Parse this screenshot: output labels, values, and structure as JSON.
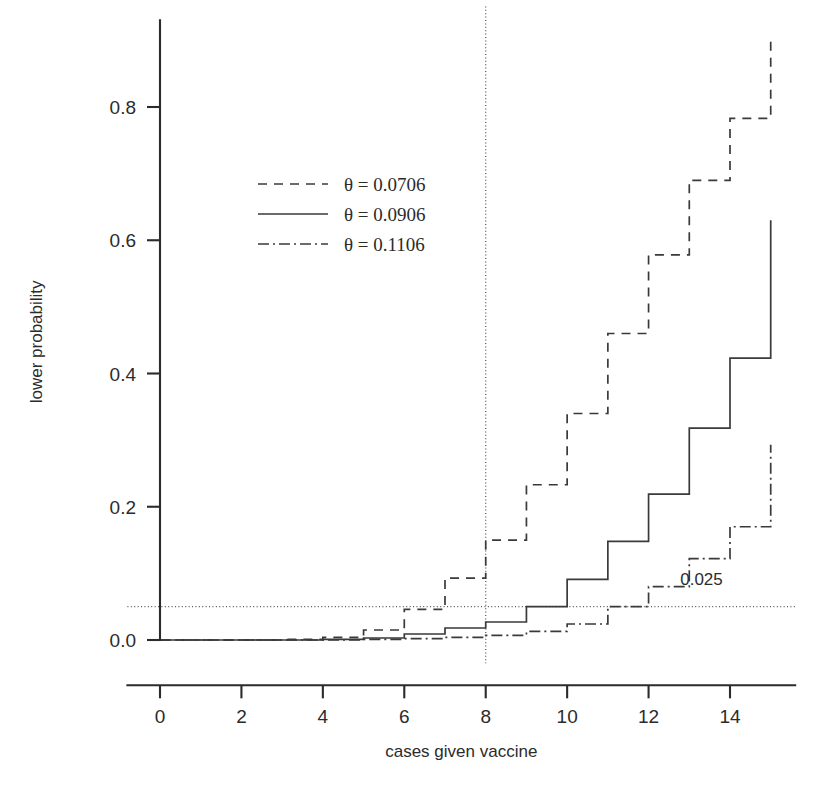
{
  "chart_data": {
    "type": "line",
    "title": "",
    "xlabel": "cases given vaccine",
    "ylabel": "lower probability",
    "xlim": [
      -0.8,
      15.6
    ],
    "ylim": [
      -0.035,
      0.93
    ],
    "xticks": [
      0,
      2,
      4,
      6,
      8,
      10,
      12,
      14
    ],
    "xtick_labels": [
      "0",
      "2",
      "4",
      "6",
      "8",
      "10",
      "12",
      "14"
    ],
    "yticks": [
      0.0,
      0.2,
      0.4,
      0.6,
      0.8
    ],
    "ytick_labels": [
      "0.0",
      "0.2",
      "0.4",
      "0.6",
      "0.8"
    ],
    "grid": false,
    "step_style": "post",
    "legend_position": "upper-left-inner",
    "x": [
      0,
      1,
      2,
      3,
      4,
      5,
      6,
      7,
      8,
      9,
      10,
      11,
      12,
      13,
      14,
      15
    ],
    "series": [
      {
        "name": "theta-0.0706",
        "label": "θ = 0.0706",
        "dash": "dashed",
        "dasharray": "9 7",
        "values": [
          0.0,
          0.0,
          0.0,
          0.001,
          0.004,
          0.015,
          0.046,
          0.093,
          0.15,
          0.233,
          0.34,
          0.46,
          0.578,
          0.69,
          0.783,
          0.855
        ]
      },
      {
        "name": "theta-0.0906",
        "label": "θ = 0.0906",
        "dash": "solid",
        "dasharray": "none",
        "values": [
          0.0,
          0.0,
          0.0,
          0.0,
          0.001,
          0.003,
          0.009,
          0.018,
          0.027,
          0.05,
          0.091,
          0.148,
          0.219,
          0.318,
          0.423,
          0.53
        ]
      },
      {
        "name": "theta-0.1106",
        "label": "θ = 0.1106",
        "dash": "dashdot",
        "dasharray": "11 4 2 4",
        "values": [
          0.0,
          0.0,
          0.0,
          0.0,
          0.0,
          0.001,
          0.002,
          0.004,
          0.007,
          0.013,
          0.024,
          0.05,
          0.08,
          0.122,
          0.17,
          0.22
        ]
      }
    ],
    "final_risers": {
      "theta-0.0706": 0.9,
      "theta-0.0906": 0.63,
      "theta-0.1106": 0.293
    },
    "reference_lines": [
      {
        "name": "alpha-level",
        "orientation": "horizontal",
        "value": 0.05,
        "label": "0.025",
        "style": "dotted"
      },
      {
        "name": "observed-cases",
        "orientation": "vertical",
        "value": 8,
        "label": "",
        "style": "dotted"
      }
    ],
    "annotations": [
      {
        "name": "alpha-annotation",
        "text": "0.025",
        "x": 13.3,
        "y": 0.082
      }
    ],
    "colors": {
      "line": "#3a3a3a",
      "axis": "#2b2b2b",
      "reference": "#555555",
      "background": "#ffffff"
    }
  }
}
